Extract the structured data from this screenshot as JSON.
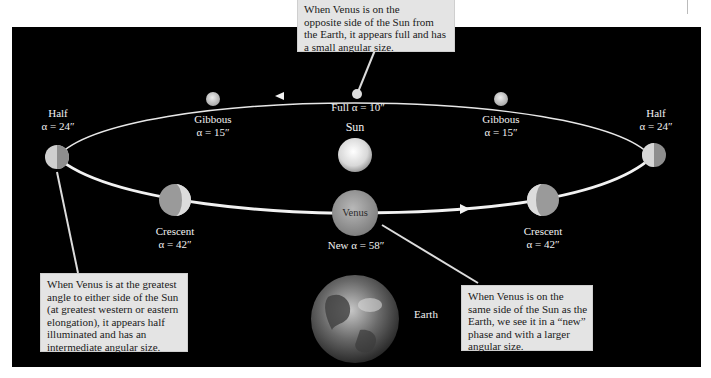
{
  "diagram": {
    "colors": {
      "background": "#000000",
      "page": "#ffffff",
      "orbit": "#e8e8e8",
      "callout_bg": "#e4e4e4",
      "label_text": "#f2f2f2"
    },
    "sun": {
      "label": "Sun"
    },
    "earth": {
      "label": "Earth"
    },
    "positions": [
      {
        "id": "full",
        "phase": "Full",
        "alpha": "α = 10″",
        "label": "Full α = 10″"
      },
      {
        "id": "gibbous-left",
        "phase": "Gibbous",
        "alpha": "α = 15″"
      },
      {
        "id": "gibbous-right",
        "phase": "Gibbous",
        "alpha": "α = 15″"
      },
      {
        "id": "half-left",
        "phase": "Half",
        "alpha": "α = 24″"
      },
      {
        "id": "half-right",
        "phase": "Half",
        "alpha": "α = 24″"
      },
      {
        "id": "crescent-left",
        "phase": "Crescent",
        "alpha": "α = 42″"
      },
      {
        "id": "crescent-right",
        "phase": "Crescent",
        "alpha": "α = 42″"
      },
      {
        "id": "new",
        "phase": "New",
        "alpha": "α = 58″",
        "label": "New α = 58″",
        "planet_label": "Venus"
      }
    ],
    "callouts": {
      "full": {
        "lines": [
          "When Venus is on the",
          "opposite side of the Sun from",
          "the Earth, it appears full and has",
          "a small angular size."
        ]
      },
      "half": {
        "lines": [
          "When Venus is at the greatest",
          "angle to either side of the Sun",
          "(at greatest western or eastern",
          "elongation), it appears half",
          "illuminated and has an",
          "intermediate angular size."
        ]
      },
      "new": {
        "lines": [
          "When Venus is on the",
          "same side of the Sun as the",
          "Earth, we see it in a “new”",
          "phase and with a larger",
          "angular size."
        ]
      }
    }
  }
}
